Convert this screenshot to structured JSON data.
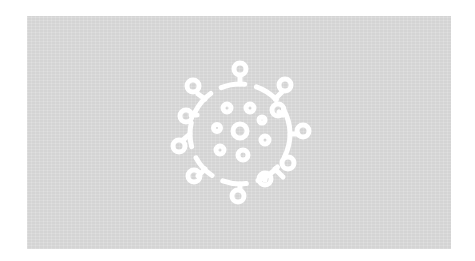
{
  "image": {
    "subject": "virus-icon",
    "background_color": "#dcdcdc",
    "icon_color": "#ffffff"
  }
}
